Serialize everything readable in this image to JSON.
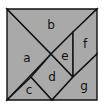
{
  "diagram": {
    "type": "tangram",
    "colors": {
      "fill": "#a9a9a9",
      "stroke": "#111111",
      "background": "#ffffff"
    },
    "pieces": [
      {
        "id": "a",
        "label": "a",
        "points": "7,9 51,54 7,100",
        "label_pos": [
          27,
          58
        ]
      },
      {
        "id": "b",
        "label": "b",
        "points": "7,9 97,9 51,54",
        "label_pos": [
          51,
          25
        ]
      },
      {
        "id": "c",
        "label": "c",
        "points": "7,100 31,77 52,100",
        "label_pos": [
          29,
          90
        ]
      },
      {
        "id": "d",
        "label": "d",
        "points": "31,77 51,54 73,77 52,100",
        "label_pos": [
          52,
          77
        ]
      },
      {
        "id": "e",
        "label": "e",
        "points": "51,54 73,32 73,77",
        "label_pos": [
          65,
          56
        ]
      },
      {
        "id": "f",
        "label": "f",
        "points": "73,32 97,9 97,54 73,77",
        "label_pos": [
          85,
          44
        ]
      },
      {
        "id": "g",
        "label": "g",
        "points": "52,100 73,77 97,54 97,100",
        "label_pos": [
          84,
          86
        ]
      }
    ]
  }
}
